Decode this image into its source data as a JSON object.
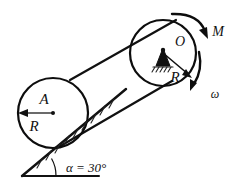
{
  "figure": {
    "background_color": "#ffffff",
    "ink_color": "#111111"
  },
  "labels": {
    "disk_center": "A",
    "disk_radius": "R",
    "pulley_center": "O",
    "pulley_radius": "R",
    "moment": "M",
    "angular_velocity": "ω",
    "incline_angle": "α = 30°"
  },
  "geometry": {
    "disk": {
      "cx": 53,
      "cy": 113,
      "r": 35
    },
    "pulley": {
      "cx": 163,
      "cy": 53,
      "r": 33
    },
    "incline": {
      "x1": 22,
      "y1": 176,
      "x2": 126,
      "y2": 89,
      "angle_deg": 30
    },
    "ground": {
      "x1": 22,
      "y1": 176,
      "x2": 99,
      "y2": 176
    }
  },
  "annotations": {
    "moment_direction": "clockwise",
    "omega_direction": "clockwise",
    "support_type": "pin-support-hatched"
  }
}
